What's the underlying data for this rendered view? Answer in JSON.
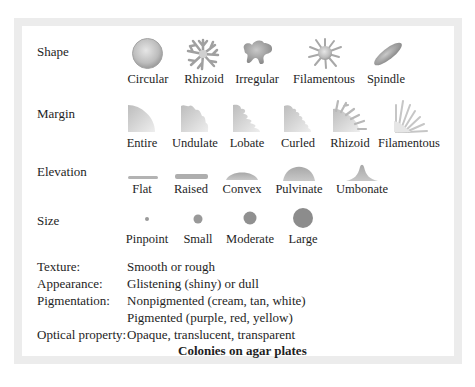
{
  "figure": {
    "title": "Colonies on agar plates",
    "rows": {
      "shape": {
        "label": "Shape",
        "items": [
          "Circular",
          "Rhizoid",
          "Irregular",
          "Filamentous",
          "Spindle"
        ]
      },
      "margin": {
        "label": "Margin",
        "items": [
          "Entire",
          "Undulate",
          "Lobate",
          "Curled",
          "Rhizoid",
          "Filamentous"
        ]
      },
      "elevation": {
        "label": "Elevation",
        "items": [
          "Flat",
          "Raised",
          "Convex",
          "Pulvinate",
          "Umbonate"
        ]
      },
      "size": {
        "label": "Size",
        "items": [
          "Pinpoint",
          "Small",
          "Moderate",
          "Large"
        ]
      }
    },
    "properties": {
      "texture": {
        "label": "Texture:",
        "value": "Smooth or rough"
      },
      "appearance": {
        "label": "Appearance:",
        "value": "Glistening (shiny) or dull"
      },
      "pigmentation": {
        "label": "Pigmentation:",
        "value": "Nonpigmented (cream, tan, white)",
        "value2": "Pigmented (purple, red, yellow)"
      },
      "optical": {
        "label": "Optical property:",
        "value": "Opaque, translucent, transparent"
      }
    },
    "colors": {
      "frame": "#ececec",
      "shape_fill": "#9a9a9a",
      "text": "#1e1e1e"
    }
  }
}
